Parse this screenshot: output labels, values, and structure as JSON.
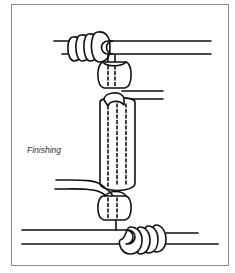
{
  "figure": {
    "caption": "Finishing",
    "colors": {
      "stroke": "#111111",
      "frame": "#8a8a8a",
      "background": "#ffffff"
    },
    "elements": [
      "top-cord",
      "top-coil-wraps",
      "upper-round-bead",
      "top-side-cord",
      "tube-bead",
      "left-side-cord",
      "lower-round-bead",
      "bottom-cord",
      "bottom-coil-wraps"
    ]
  }
}
